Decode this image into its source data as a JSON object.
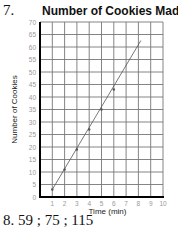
{
  "question_number": "7.",
  "answer_line": "8.  59 ; 75 ; 115",
  "chart_data": {
    "type": "line",
    "title": "Number of Cookies Made",
    "xlabel": "Time (min)",
    "ylabel": "Number of Cookies",
    "xlim": [
      0,
      10
    ],
    "ylim": [
      0,
      70
    ],
    "x_ticks": [
      1,
      2,
      3,
      4,
      5,
      6,
      7,
      8,
      9,
      10
    ],
    "y_ticks": [
      0,
      5,
      10,
      15,
      20,
      25,
      30,
      35,
      40,
      45,
      50,
      55,
      60,
      65,
      70
    ],
    "grid": true,
    "series": [
      {
        "name": "Cookies",
        "points": [
          {
            "x": 1,
            "y": 3
          },
          {
            "x": 2,
            "y": 11
          },
          {
            "x": 3,
            "y": 19
          },
          {
            "x": 4,
            "y": 27
          },
          {
            "x": 5,
            "y": 35
          },
          {
            "x": 6,
            "y": 43
          }
        ],
        "line_extends_to": {
          "x": 8.2,
          "y": 62.6
        }
      }
    ]
  }
}
